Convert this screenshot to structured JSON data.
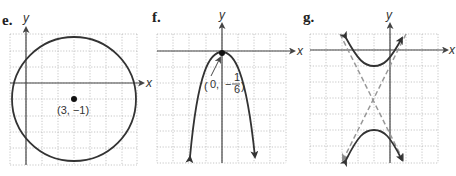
{
  "graphs": [
    {
      "id": "e",
      "label": "e.",
      "x_axis_label": "x",
      "y_axis_label": "y",
      "shape": "circle",
      "point_label": "(3, −1)",
      "center": [
        3,
        -1
      ],
      "radius_units": 4
    },
    {
      "id": "f",
      "label": "f.",
      "x_axis_label": "x",
      "y_axis_label": "y",
      "shape": "parabola",
      "point_label_x": "0,",
      "point_label_num": "1",
      "point_label_den": "6",
      "vertex": [
        0,
        -0.1667
      ],
      "opens": "down"
    },
    {
      "id": "g",
      "label": "g.",
      "x_axis_label": "x",
      "y_axis_label": "y",
      "shape": "hyperbola",
      "orientation": "vertical",
      "has_asymptotes": true
    }
  ],
  "colors": {
    "curve": "#333333",
    "grid": "#b8b8b8",
    "asymptote": "#999999"
  }
}
